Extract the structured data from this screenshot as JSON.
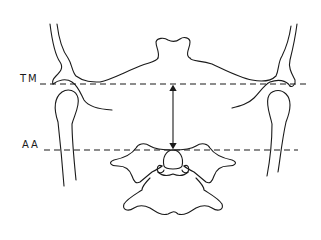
{
  "diagram": {
    "type": "anatomical line drawing",
    "stroke_color": "#1a1a1a",
    "background": "#ffffff"
  },
  "labels": {
    "upper_line": "TM",
    "lower_line": "AA"
  },
  "reference_lines": [
    {
      "id": "TM",
      "style": "dashed",
      "y": 84,
      "x_start": 40,
      "x_end": 307
    },
    {
      "id": "AA",
      "style": "dashed",
      "y": 150,
      "x_start": 44,
      "x_end": 298
    }
  ],
  "measurement": {
    "type": "double-headed arrow",
    "x": 173,
    "from_line": "TM",
    "to_line": "AA"
  }
}
